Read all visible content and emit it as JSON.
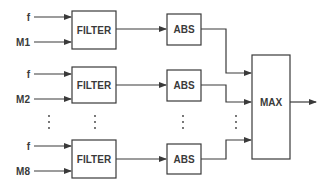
{
  "diagram": {
    "channels": [
      {
        "freq_label": "f",
        "input_label": "M1",
        "filter_label": "FILTER",
        "abs_label": "ABS"
      },
      {
        "freq_label": "f",
        "input_label": "M2",
        "filter_label": "FILTER",
        "abs_label": "ABS"
      },
      {
        "freq_label": "f",
        "input_label": "M8",
        "filter_label": "FILTER",
        "abs_label": "ABS"
      }
    ],
    "max_label": "MAX",
    "ellipsis": "⋮",
    "line_color": "#3a3a3a"
  }
}
